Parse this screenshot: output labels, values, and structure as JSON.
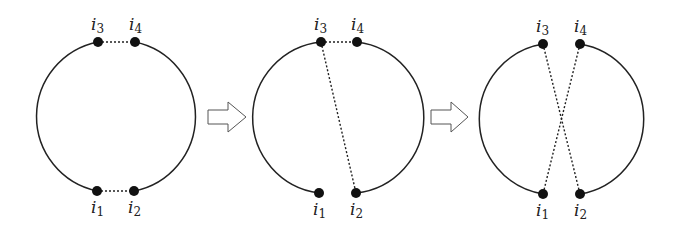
{
  "figure": {
    "panels": [
      {
        "name": "panel-1",
        "labels": {
          "i1": "i",
          "i1_sub": "1",
          "i2": "i",
          "i2_sub": "2",
          "i3": "i",
          "i3_sub": "3",
          "i4": "i",
          "i4_sub": "4"
        },
        "description": "Circle with dotted links i3–i4 (top) and i1–i2 (bottom)"
      },
      {
        "name": "panel-2",
        "labels": {
          "i1": "i",
          "i1_sub": "1",
          "i2": "i",
          "i2_sub": "2",
          "i3": "i",
          "i3_sub": "3",
          "i4": "i",
          "i4_sub": "4"
        },
        "description": "Dotted links i3–i4 and i3–i2; gap between i1 and i2"
      },
      {
        "name": "panel-3",
        "labels": {
          "i1": "i",
          "i1_sub": "1",
          "i2": "i",
          "i2_sub": "2",
          "i3": "i",
          "i3_sub": "3",
          "i4": "i",
          "i4_sub": "4"
        },
        "description": "Dotted crossing links i3–i2 and i4–i1"
      }
    ],
    "arrows": [
      {
        "name": "arrow-1",
        "direction": "right"
      },
      {
        "name": "arrow-2",
        "direction": "right"
      }
    ],
    "colors": {
      "stroke": "#222222",
      "node": "#111111",
      "arrow_stroke": "#555555"
    }
  }
}
